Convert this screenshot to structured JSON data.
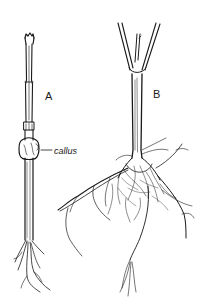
{
  "figure": {
    "labels": {
      "a": "A",
      "b": "B",
      "callus": "callus"
    },
    "colors": {
      "ink": "#1a1a1a",
      "background": "#ffffff"
    }
  }
}
